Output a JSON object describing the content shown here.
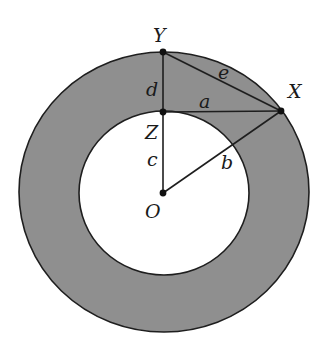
{
  "diagram": {
    "type": "annulus-geometry",
    "colors": {
      "background": "#ffffff",
      "annulus_fill": "#8f8f8f",
      "inner_fill": "#ffffff",
      "stroke": "#1e1e1e",
      "point": "#111111"
    },
    "circles": {
      "outer": {
        "cx": 164,
        "cy": 192,
        "rx": 145,
        "ry": 140
      },
      "inner": {
        "cx": 164,
        "cy": 193,
        "rx": 85,
        "ry": 82
      }
    },
    "points": [
      {
        "id": "Y",
        "label": "Y",
        "x": 163,
        "y": 52
      },
      {
        "id": "Z",
        "label": "Z",
        "x": 163,
        "y": 112
      },
      {
        "id": "X",
        "label": "X",
        "x": 281,
        "y": 111
      },
      {
        "id": "O",
        "label": "O",
        "x": 163,
        "y": 193
      }
    ],
    "segments": [
      {
        "from": "Y",
        "to": "Z",
        "label": "d"
      },
      {
        "from": "Z",
        "to": "O",
        "label": "c"
      },
      {
        "from": "Z",
        "to": "X",
        "label": "a"
      },
      {
        "from": "Y",
        "to": "X",
        "label": "e"
      },
      {
        "from": "O",
        "to": "X",
        "label": "b"
      }
    ],
    "labels": {
      "Y": "Y",
      "X": "X",
      "Z": "Z",
      "O": "O",
      "a": "a",
      "b": "b",
      "c": "c",
      "d": "d",
      "e": "e"
    }
  }
}
